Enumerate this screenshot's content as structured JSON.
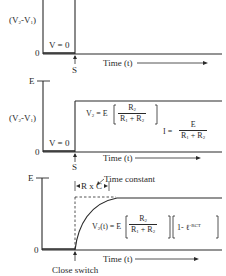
{
  "panel_top": {
    "y_label": "(V2-V1)",
    "zero_label": "0",
    "region_label": "V = 0",
    "switch_label": "S",
    "x_label": "Time (t)"
  },
  "panel_middle": {
    "top_label": "E",
    "y_label": "(V2-V1)",
    "zero_label": "0",
    "region_label": "V = 0",
    "switch_label": "S",
    "x_label": "Time (t)",
    "formula_v2": {
      "lhs": "V2 = E",
      "numerator": "R2",
      "denominator": "R1 + R2"
    },
    "formula_i": {
      "lhs": "I =",
      "numerator": "E",
      "denominator": "R1 + R2"
    }
  },
  "panel_bottom": {
    "top_label": "E",
    "zero_label": "0",
    "time_constant_label": "Time constant",
    "rc_label": "R x C",
    "x_label": "Time (t)",
    "switch_label": "Close switch",
    "formula": {
      "lhs": "V2(t) = E",
      "numerator": "R2",
      "denominator": "R1 + R2",
      "factor": "1- ℓ",
      "exponent": "-RCT"
    }
  },
  "colors": {
    "ink": "#2a2a2a",
    "background": "#ffffff"
  }
}
